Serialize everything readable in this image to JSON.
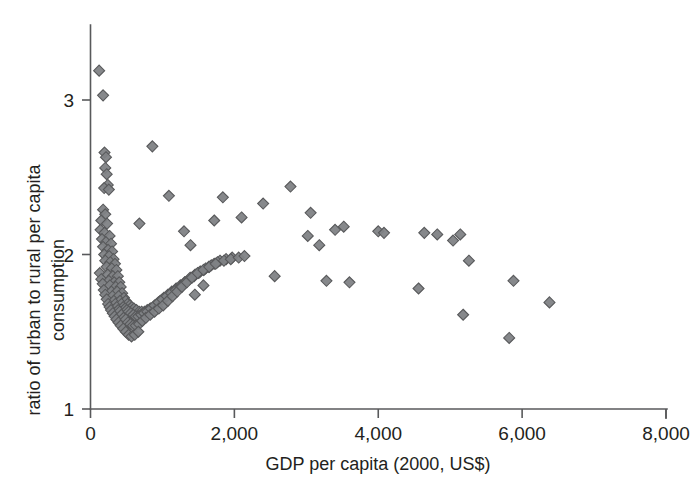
{
  "chart_data": {
    "type": "scatter",
    "title": "",
    "xlabel": "GDP per capita (2000, US$)",
    "ylabel": "ratio of urban to rural per capita consumption",
    "xlim": [
      0,
      8000
    ],
    "ylim": [
      1,
      3.3
    ],
    "grid": false,
    "legend": null,
    "xticks": [
      0,
      2000,
      4000,
      6000,
      8000
    ],
    "xtick_labels": [
      "0",
      "2,000",
      "4,000",
      "6,000",
      "8,000"
    ],
    "yticks": [
      1,
      2,
      3
    ],
    "ytick_labels": [
      "1",
      "2",
      "3"
    ],
    "marker": {
      "shape": "diamond",
      "fill": "#808285",
      "stroke": "#58595b",
      "size": 11
    },
    "series": [
      {
        "name": "countries",
        "points": [
          [
            120,
            3.19
          ],
          [
            175,
            3.03
          ],
          [
            195,
            2.66
          ],
          [
            215,
            2.63
          ],
          [
            205,
            2.56
          ],
          [
            225,
            2.52
          ],
          [
            240,
            2.45
          ],
          [
            190,
            2.43
          ],
          [
            255,
            2.42
          ],
          [
            175,
            2.29
          ],
          [
            205,
            2.26
          ],
          [
            150,
            2.22
          ],
          [
            230,
            2.2
          ],
          [
            140,
            2.16
          ],
          [
            195,
            2.14
          ],
          [
            265,
            2.12
          ],
          [
            160,
            2.1
          ],
          [
            215,
            2.08
          ],
          [
            285,
            2.07
          ],
          [
            175,
            2.05
          ],
          [
            245,
            2.03
          ],
          [
            300,
            2.02
          ],
          [
            190,
            2.0
          ],
          [
            260,
            1.99
          ],
          [
            320,
            1.97
          ],
          [
            205,
            1.96
          ],
          [
            275,
            1.95
          ],
          [
            340,
            1.94
          ],
          [
            225,
            1.92
          ],
          [
            295,
            1.91
          ],
          [
            360,
            1.9
          ],
          [
            130,
            1.88
          ],
          [
            240,
            1.87
          ],
          [
            310,
            1.86
          ],
          [
            380,
            1.86
          ],
          [
            150,
            1.84
          ],
          [
            255,
            1.83
          ],
          [
            330,
            1.82
          ],
          [
            400,
            1.82
          ],
          [
            170,
            1.81
          ],
          [
            270,
            1.8
          ],
          [
            350,
            1.79
          ],
          [
            420,
            1.79
          ],
          [
            185,
            1.77
          ],
          [
            290,
            1.76
          ],
          [
            370,
            1.76
          ],
          [
            440,
            1.75
          ],
          [
            205,
            1.74
          ],
          [
            305,
            1.73
          ],
          [
            390,
            1.73
          ],
          [
            465,
            1.72
          ],
          [
            225,
            1.71
          ],
          [
            325,
            1.7
          ],
          [
            410,
            1.7
          ],
          [
            490,
            1.7
          ],
          [
            245,
            1.68
          ],
          [
            345,
            1.68
          ],
          [
            430,
            1.68
          ],
          [
            515,
            1.68
          ],
          [
            265,
            1.66
          ],
          [
            365,
            1.66
          ],
          [
            455,
            1.66
          ],
          [
            545,
            1.67
          ],
          [
            285,
            1.64
          ],
          [
            385,
            1.64
          ],
          [
            480,
            1.65
          ],
          [
            575,
            1.66
          ],
          [
            310,
            1.62
          ],
          [
            405,
            1.63
          ],
          [
            505,
            1.64
          ],
          [
            605,
            1.65
          ],
          [
            335,
            1.6
          ],
          [
            430,
            1.61
          ],
          [
            530,
            1.63
          ],
          [
            640,
            1.64
          ],
          [
            360,
            1.58
          ],
          [
            460,
            1.59
          ],
          [
            560,
            1.62
          ],
          [
            675,
            1.63
          ],
          [
            390,
            1.56
          ],
          [
            490,
            1.58
          ],
          [
            595,
            1.61
          ],
          [
            710,
            1.63
          ],
          [
            420,
            1.54
          ],
          [
            520,
            1.56
          ],
          [
            630,
            1.6
          ],
          [
            750,
            1.63
          ],
          [
            455,
            1.52
          ],
          [
            555,
            1.55
          ],
          [
            665,
            1.6
          ],
          [
            790,
            1.64
          ],
          [
            490,
            1.5
          ],
          [
            590,
            1.54
          ],
          [
            705,
            1.61
          ],
          [
            830,
            1.65
          ],
          [
            530,
            1.48
          ],
          [
            630,
            1.54
          ],
          [
            745,
            1.62
          ],
          [
            875,
            1.66
          ],
          [
            570,
            1.47
          ],
          [
            675,
            1.55
          ],
          [
            790,
            1.63
          ],
          [
            920,
            1.68
          ],
          [
            615,
            1.48
          ],
          [
            720,
            1.57
          ],
          [
            840,
            1.65
          ],
          [
            970,
            1.7
          ],
          [
            665,
            1.5
          ],
          [
            770,
            1.59
          ],
          [
            890,
            1.67
          ],
          [
            1020,
            1.72
          ],
          [
            830,
            1.61
          ],
          [
            945,
            1.69
          ],
          [
            1075,
            1.74
          ],
          [
            890,
            1.63
          ],
          [
            1000,
            1.71
          ],
          [
            1130,
            1.76
          ],
          [
            950,
            1.65
          ],
          [
            1060,
            1.73
          ],
          [
            1190,
            1.78
          ],
          [
            1010,
            1.67
          ],
          [
            1120,
            1.75
          ],
          [
            1250,
            1.8
          ],
          [
            1075,
            1.7
          ],
          [
            1185,
            1.77
          ],
          [
            1310,
            1.82
          ],
          [
            1140,
            1.73
          ],
          [
            1250,
            1.79
          ],
          [
            1375,
            1.84
          ],
          [
            1205,
            1.76
          ],
          [
            1315,
            1.82
          ],
          [
            1440,
            1.86
          ],
          [
            1270,
            1.79
          ],
          [
            1385,
            1.85
          ],
          [
            1505,
            1.88
          ],
          [
            1340,
            1.82
          ],
          [
            1455,
            1.87
          ],
          [
            1575,
            1.9
          ],
          [
            1410,
            1.85
          ],
          [
            1525,
            1.89
          ],
          [
            1645,
            1.92
          ],
          [
            1490,
            1.88
          ],
          [
            1600,
            1.91
          ],
          [
            1720,
            1.94
          ],
          [
            1570,
            1.9
          ],
          [
            1680,
            1.93
          ],
          [
            1800,
            1.96
          ],
          [
            1650,
            1.92
          ],
          [
            1765,
            1.95
          ],
          [
            1885,
            1.97
          ],
          [
            1740,
            1.94
          ],
          [
            1855,
            1.96
          ],
          [
            1970,
            1.98
          ],
          [
            1950,
            1.97
          ],
          [
            2060,
            1.98
          ],
          [
            2140,
            1.99
          ],
          [
            860,
            2.7
          ],
          [
            680,
            2.2
          ],
          [
            1090,
            2.38
          ],
          [
            1300,
            2.15
          ],
          [
            1390,
            2.06
          ],
          [
            1720,
            2.22
          ],
          [
            1840,
            2.37
          ],
          [
            1450,
            1.74
          ],
          [
            1570,
            1.8
          ],
          [
            2100,
            2.24
          ],
          [
            2400,
            2.33
          ],
          [
            2780,
            2.44
          ],
          [
            2560,
            1.86
          ],
          [
            3020,
            2.12
          ],
          [
            3060,
            2.27
          ],
          [
            3180,
            2.06
          ],
          [
            3280,
            1.83
          ],
          [
            3400,
            2.16
          ],
          [
            3520,
            2.18
          ],
          [
            3600,
            1.82
          ],
          [
            4000,
            2.15
          ],
          [
            4080,
            2.14
          ],
          [
            4560,
            1.78
          ],
          [
            4640,
            2.14
          ],
          [
            4820,
            2.13
          ],
          [
            5040,
            2.09
          ],
          [
            5140,
            2.13
          ],
          [
            5180,
            1.61
          ],
          [
            5260,
            1.96
          ],
          [
            5820,
            1.46
          ],
          [
            5880,
            1.83
          ],
          [
            6380,
            1.69
          ]
        ]
      }
    ]
  },
  "axis": {
    "x_axis_name": "x-axis",
    "y_axis_name": "y-axis"
  }
}
